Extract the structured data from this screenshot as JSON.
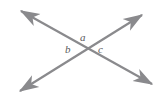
{
  "figure": {
    "type": "geometry-diagram",
    "background_color": "#ffffff",
    "line_color": "#8a8a8d",
    "label_color": "#59595b",
    "stroke_width": 2.2,
    "intersection": {
      "x": 85,
      "y": 47
    },
    "lines": [
      {
        "name": "line-upper-left-to-lower-right",
        "x1": 21,
        "y1": 11,
        "x2": 152,
        "y2": 84,
        "arrow_start": true,
        "arrow_end": true
      },
      {
        "name": "line-lower-left-to-upper-right",
        "x1": 20,
        "y1": 91,
        "x2": 142,
        "y2": 15,
        "arrow_start": true,
        "arrow_end": true
      }
    ],
    "labels": [
      {
        "name": "angle-label-a",
        "text": "a",
        "x": 80,
        "y": 32,
        "position": "above-intersection"
      },
      {
        "name": "angle-label-b",
        "text": "b",
        "x": 65,
        "y": 44,
        "position": "left-of-intersection"
      },
      {
        "name": "angle-label-c",
        "text": "c",
        "x": 98,
        "y": 44,
        "position": "right-of-intersection"
      }
    ]
  }
}
